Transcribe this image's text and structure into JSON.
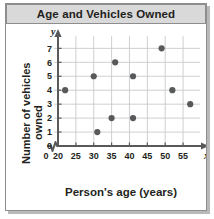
{
  "figure": {
    "title": "Age and Vehicles Owned",
    "x_axis_title": "Person's age (years)",
    "y_axis_title_line1": "Number of vehicles",
    "y_axis_title_line2": "owned",
    "x_variable_symbol": "x",
    "y_variable_symbol": "y"
  },
  "colors": {
    "banner_background": "#d9d9d9",
    "border": "#8d8d8d",
    "grid": "#c9c9c9",
    "axis": "#58595b",
    "point": "#58595b",
    "text": "#231f20",
    "plot_background": "#ffffff"
  },
  "chart_data": {
    "type": "scatter",
    "title": "Age and Vehicles Owned",
    "xlabel": "Person's age (years)",
    "ylabel": "Number of vehicles owned",
    "x_ticks": [
      0,
      20,
      25,
      30,
      35,
      40,
      45,
      50,
      55
    ],
    "y_ticks": [
      0,
      1,
      2,
      3,
      4,
      5,
      6,
      7
    ],
    "xlim": [
      20,
      57.5
    ],
    "ylim": [
      0,
      7.6
    ],
    "x_axis_break": true,
    "grid": true,
    "legend": "none",
    "points": [
      {
        "x": 22,
        "y": 4
      },
      {
        "x": 30,
        "y": 5
      },
      {
        "x": 31,
        "y": 1
      },
      {
        "x": 35,
        "y": 2
      },
      {
        "x": 36,
        "y": 6
      },
      {
        "x": 41,
        "y": 5
      },
      {
        "x": 41,
        "y": 2
      },
      {
        "x": 49,
        "y": 7
      },
      {
        "x": 52,
        "y": 4
      },
      {
        "x": 57,
        "y": 3
      }
    ]
  }
}
